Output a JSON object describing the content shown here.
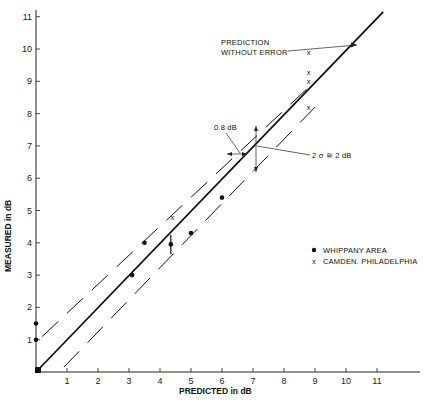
{
  "chart_data": {
    "type": "scatter",
    "title": "",
    "xlabel": "PREDICTED in dB",
    "ylabel": "MEASURED in dB",
    "xlim": [
      0,
      12
    ],
    "ylim": [
      0,
      11.5
    ],
    "x_ticks": [
      "1",
      "2",
      "3",
      "4",
      "5",
      "6",
      "7",
      "8",
      "9",
      "10",
      "11"
    ],
    "y_ticks": [
      "1",
      "2",
      "3",
      "4",
      "5",
      "6",
      "7",
      "8",
      "9",
      "10",
      "11"
    ],
    "grid": false,
    "legend_position": "right-middle",
    "series": [
      {
        "name": "WHIPPANY AREA",
        "marker": "dot",
        "points": [
          {
            "x": 0.0,
            "y": 1.0
          },
          {
            "x": 0.0,
            "y": 1.5
          },
          {
            "x": 0.05,
            "y": 0.05
          },
          {
            "x": 3.1,
            "y": 3.0
          },
          {
            "x": 3.5,
            "y": 4.0
          },
          {
            "x": 4.35,
            "y": 3.95
          },
          {
            "x": 5.0,
            "y": 4.3
          },
          {
            "x": 6.0,
            "y": 5.4
          }
        ]
      },
      {
        "name": "CAMDEN. PHILADELPHIA",
        "marker": "x",
        "points": [
          {
            "x": 4.4,
            "y": 4.8
          },
          {
            "x": 8.8,
            "y": 9.9
          },
          {
            "x": 8.8,
            "y": 9.3
          },
          {
            "x": 8.8,
            "y": 9.0
          },
          {
            "x": 8.8,
            "y": 8.2
          }
        ]
      }
    ],
    "lines": [
      {
        "name": "PREDICTION WITHOUT ERROR",
        "style": "solid",
        "from": [
          0,
          0
        ],
        "to": [
          11.2,
          11.15
        ]
      },
      {
        "name": "upper bound (+1 dB)",
        "style": "dashed",
        "from": [
          0.2,
          1.1
        ],
        "to": [
          9.0,
          9.0
        ]
      },
      {
        "name": "lower bound (-1 dB)",
        "style": "dashed",
        "from": [
          0.9,
          0.15
        ],
        "to": [
          9.0,
          8.2
        ]
      }
    ],
    "annotations": [
      {
        "text_lines": [
          "PREDICTION",
          "WITHOUT ERROR"
        ],
        "points_to": "solid line"
      },
      {
        "text": "0.8 dB",
        "meaning": "horizontal offset between bounds"
      },
      {
        "text": "2 σ ≅ 2 dB",
        "meaning": "vertical width of band"
      }
    ]
  },
  "labels": {
    "xlabel": "PREDICTED in dB",
    "ylabel": "MEASURED in dB",
    "annot_prediction_1": "PREDICTION",
    "annot_prediction_2": "WITHOUT ERROR",
    "annot_08db": "0.8 dB",
    "annot_2sigma": "2 σ ≅ 2 dB",
    "legend_whippany": "WHIPPANY AREA",
    "legend_camden": "CAMDEN. PHILADELPHIA"
  }
}
